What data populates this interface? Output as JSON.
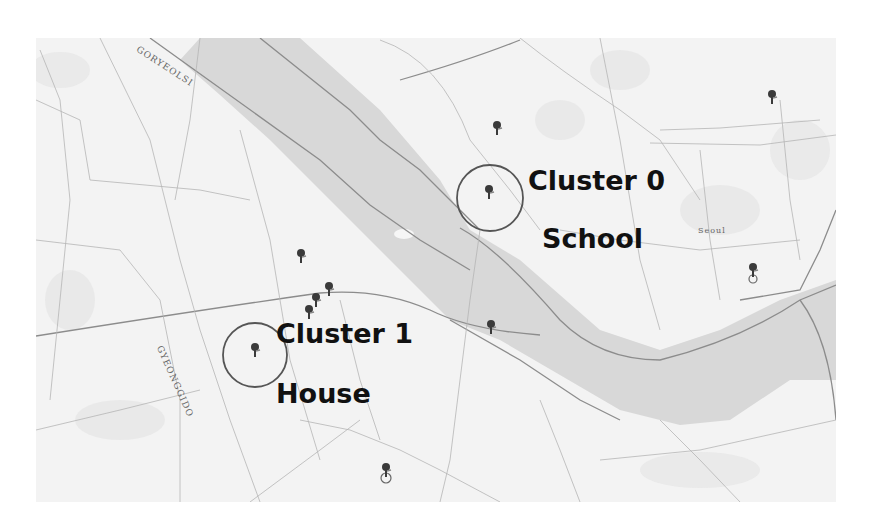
{
  "map": {
    "place_labels": [
      {
        "text": "GORYEOLSI",
        "x": 140,
        "y": 44,
        "rotate": 33
      },
      {
        "text": "GYEONGGIDO",
        "x": 140,
        "y": 370,
        "rotate": 66
      },
      {
        "text": "Seoul",
        "x": 700,
        "y": 228,
        "rotate": 0
      }
    ],
    "clusters": [
      {
        "id": "cluster-0",
        "title": "Cluster 0",
        "subtitle": "School",
        "circle": {
          "cx": 490,
          "cy": 198,
          "r": 33
        }
      },
      {
        "id": "cluster-1",
        "title": "Cluster 1",
        "subtitle": "House",
        "circle": {
          "cx": 255,
          "cy": 355,
          "r": 32
        }
      }
    ],
    "pins": [
      {
        "x": 497,
        "y": 128
      },
      {
        "x": 489,
        "y": 192
      },
      {
        "x": 772,
        "y": 97
      },
      {
        "x": 753,
        "y": 270
      },
      {
        "x": 301,
        "y": 256
      },
      {
        "x": 329,
        "y": 289
      },
      {
        "x": 316,
        "y": 300
      },
      {
        "x": 309,
        "y": 312
      },
      {
        "x": 491,
        "y": 327
      },
      {
        "x": 255,
        "y": 350
      },
      {
        "x": 386,
        "y": 470
      }
    ],
    "colors": {
      "background": "#f3f3f3",
      "river": "#d9d9d9",
      "road": "#9a9a9a",
      "pin": "#3a3a3a",
      "circle": "#555555",
      "label": "#111111"
    }
  }
}
